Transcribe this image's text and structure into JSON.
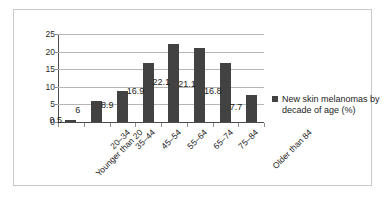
{
  "chart_data": {
    "type": "bar",
    "title": "",
    "xlabel": "",
    "ylabel": "",
    "ylim": [
      0,
      25
    ],
    "yticks": [
      0,
      5,
      10,
      15,
      20,
      25
    ],
    "grid": true,
    "legend_position": "right",
    "categories": [
      "Younger than 20",
      "20–34",
      "35–44",
      "45–54",
      "55–64",
      "65–74",
      "75–84",
      "Older than 84"
    ],
    "series": [
      {
        "name": "New skin melanomas by decade of age (%)",
        "color": "#424242",
        "values": [
          0.5,
          6,
          8.9,
          16.9,
          22.1,
          21.1,
          16.8,
          7.7
        ],
        "value_labels": [
          "0.5",
          "6",
          "8.9",
          "16.9",
          "22.1",
          "21.1",
          "16.8",
          "7.7"
        ]
      }
    ]
  },
  "legend": {
    "entries": [
      {
        "label": "New skin melanomas by decade of age (%)",
        "color": "#424242"
      }
    ]
  },
  "axis": {
    "y_tick_labels": [
      "25",
      "20",
      "15",
      "10",
      "5",
      "0"
    ]
  }
}
